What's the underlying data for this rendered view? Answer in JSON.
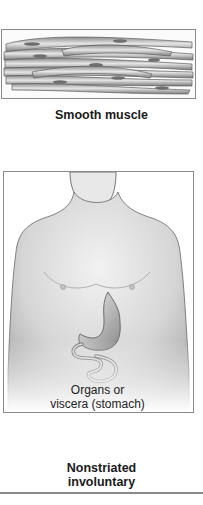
{
  "panel": {
    "tissue_illustration": {
      "icon": "smooth-muscle-fibers-illustration",
      "label": "Smooth muscle"
    },
    "location_illustration": {
      "icon": "male-torso-with-stomach-illustration",
      "label_line1": "Organs or",
      "label_line2": "viscera (stomach)"
    },
    "classification": {
      "line1": "Nonstriated",
      "line2": "involuntary"
    }
  },
  "colors": {
    "border": "#8a8a8a",
    "skin": "#d9d9d9",
    "fiber": "#9a9a9a",
    "nucleus": "#6e6e6e"
  }
}
